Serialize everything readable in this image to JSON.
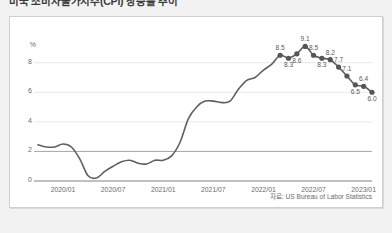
{
  "title": "미국 소비자물가지수(CPI) 상승률 추이",
  "source_note": "자료: US Bureau of Labor Statistics",
  "colors": {
    "line": "#5f5f63",
    "marker": "#55555a",
    "grid": "#e3e3e5",
    "axis": "#8d8d90",
    "emphasis_grid": "#9b9b9e",
    "panel_bg": "#ffffff",
    "page_bg": "#f2f2f2",
    "label_text": "#5a5a5a"
  },
  "chart_data": {
    "type": "line",
    "title": "미국 소비자물가지수(CPI) 상승률 추이",
    "xlabel": "",
    "ylabel": "%",
    "ylim": [
      0,
      9.6
    ],
    "yticks": [
      0,
      2,
      4,
      6,
      8
    ],
    "ytick_labels": [
      "0",
      "2",
      "4",
      "6",
      "8"
    ],
    "grid": true,
    "emphasis_line": 2,
    "legend": "none",
    "xtick_labels": [
      "2020/01",
      "2020/07",
      "2021/01",
      "2021/07",
      "2022/01",
      "2022/07",
      "2023/01"
    ],
    "xtick_x": [
      "2020-01",
      "2020-07",
      "2021-01",
      "2021-07",
      "2022-01",
      "2022-07",
      "2023-01"
    ],
    "x": [
      "2019-10",
      "2019-11",
      "2019-12",
      "2020-01",
      "2020-02",
      "2020-03",
      "2020-04",
      "2020-05",
      "2020-06",
      "2020-07",
      "2020-08",
      "2020-09",
      "2020-10",
      "2020-11",
      "2020-12",
      "2021-01",
      "2021-02",
      "2021-03",
      "2021-04",
      "2021-05",
      "2021-06",
      "2021-07",
      "2021-08",
      "2021-09",
      "2021-10",
      "2021-11",
      "2021-12",
      "2022-01",
      "2022-02",
      "2022-03",
      "2022-04",
      "2022-05",
      "2022-06",
      "2022-07",
      "2022-08",
      "2022-09",
      "2022-10",
      "2022-11",
      "2022-12",
      "2023-01",
      "2023-02"
    ],
    "values": [
      2.45,
      2.3,
      2.3,
      2.5,
      2.3,
      1.5,
      0.35,
      0.2,
      0.65,
      1.0,
      1.3,
      1.4,
      1.2,
      1.15,
      1.4,
      1.4,
      1.7,
      2.6,
      4.2,
      5.0,
      5.4,
      5.4,
      5.3,
      5.4,
      6.2,
      6.8,
      7.0,
      7.5,
      7.9,
      8.5,
      8.3,
      8.6,
      9.1,
      8.5,
      8.3,
      8.2,
      7.7,
      7.1,
      6.5,
      6.4,
      6.0
    ],
    "labeled_points": [
      {
        "x": "2022-03",
        "value": 8.5,
        "label": "8.5",
        "position": "above"
      },
      {
        "x": "2022-04",
        "value": 8.3,
        "label": "8.3",
        "position": "below"
      },
      {
        "x": "2022-05",
        "value": 8.6,
        "label": "8.6",
        "position": "below"
      },
      {
        "x": "2022-06",
        "value": 9.1,
        "label": "9.1",
        "position": "above"
      },
      {
        "x": "2022-07",
        "value": 8.5,
        "label": "8.5",
        "position": "above"
      },
      {
        "x": "2022-08",
        "value": 8.3,
        "label": "8.3",
        "position": "below"
      },
      {
        "x": "2022-09",
        "value": 8.2,
        "label": "8.2",
        "position": "above"
      },
      {
        "x": "2022-10",
        "value": 7.7,
        "label": "7.7",
        "position": "above"
      },
      {
        "x": "2022-11",
        "value": 7.1,
        "label": "7.1",
        "position": "above"
      },
      {
        "x": "2022-12",
        "value": 6.5,
        "label": "6.5",
        "position": "below"
      },
      {
        "x": "2023-01",
        "value": 6.4,
        "label": "6.4",
        "position": "above"
      },
      {
        "x": "2023-02",
        "value": 6.0,
        "label": "6.0",
        "position": "below"
      }
    ]
  },
  "axis": {
    "y_unit": "%",
    "y_ticks": [
      "8",
      "6",
      "4",
      "2",
      "0"
    ],
    "x_ticks": [
      "2020/01",
      "2020/07",
      "2021/01",
      "2021/07",
      "2022/01",
      "2022/07",
      "2023/01"
    ]
  }
}
